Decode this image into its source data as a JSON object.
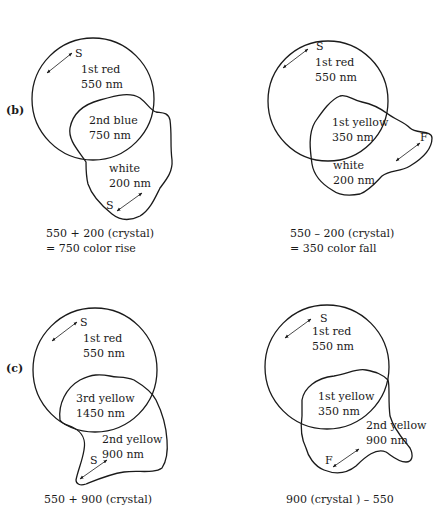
{
  "figure": {
    "panels": [
      {
        "id": "b-left",
        "panel_label": "(b)",
        "circle_label_1": "1st red",
        "circle_label_2": "550 nm",
        "overlap_label_1": "2nd blue",
        "overlap_label_2": "750 nm",
        "crystal_label_1": "white",
        "crystal_label_2": "200 nm",
        "vibration_circle": "S",
        "vibration_crystal": "S",
        "caption_1": "550 + 200 (crystal)",
        "caption_2": "= 750 color rise"
      },
      {
        "id": "b-right",
        "circle_label_1": "1st red",
        "circle_label_2": "550 nm",
        "overlap_label_1": "1st yellow",
        "overlap_label_2": "350 nm",
        "crystal_label_1": "white",
        "crystal_label_2": "200 nm",
        "vibration_circle": "S",
        "vibration_crystal": "F",
        "caption_1": "550 – 200 (crystal)",
        "caption_2": "= 350 color fall"
      },
      {
        "id": "c-left",
        "panel_label": "(c)",
        "circle_label_1": "1st red",
        "circle_label_2": "550 nm",
        "overlap_label_1": "3rd yellow",
        "overlap_label_2": "1450 nm",
        "crystal_label_1": "2nd yellow",
        "crystal_label_2": "900 nm",
        "vibration_circle": "S",
        "vibration_crystal": "S",
        "caption_1": "550 + 900 (crystal)"
      },
      {
        "id": "c-right",
        "circle_label_1": "1st red",
        "circle_label_2": "550 nm",
        "overlap_label_1": "1st yellow",
        "overlap_label_2": "350 nm",
        "crystal_label_1": "2nd yellow",
        "crystal_label_2": "900 nm",
        "vibration_circle": "S",
        "vibration_crystal": "F",
        "caption_1": "900 (crystal ) – 550"
      }
    ]
  }
}
